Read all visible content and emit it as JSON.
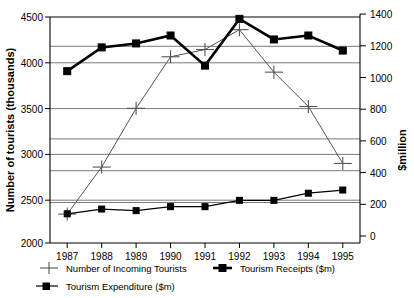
{
  "chart_data": {
    "type": "line",
    "title": "",
    "xlabel": "",
    "ylabel": "Number of tourists (thousands)",
    "y2label": "$million",
    "categories": [
      "1987",
      "1988",
      "1989",
      "1990",
      "1991",
      "1992",
      "1993",
      "1994",
      "1995"
    ],
    "ylim": [
      2000,
      4500
    ],
    "y2lim": [
      0,
      1400
    ],
    "yticks": [
      "2000",
      "2500",
      "3000",
      "3500",
      "4000",
      "4500"
    ],
    "y2ticks": [
      "0",
      "200",
      "400",
      "600",
      "800",
      "1000",
      "1200",
      "1400"
    ],
    "grid": true,
    "legend_position": "bottom-left",
    "series": [
      {
        "name": "Number of Incoming Tourists",
        "axis": "left",
        "marker": "cross",
        "values": [
          2320,
          2840,
          3490,
          4060,
          4140,
          4360,
          3890,
          3510,
          2880
        ]
      },
      {
        "name": "Tourism Receipts ($m)",
        "axis": "right",
        "marker": "square",
        "values": [
          1040,
          1190,
          1215,
          1265,
          1075,
          1370,
          1240,
          1265,
          1170
        ]
      },
      {
        "name": "Tourism Expenditure ($m)",
        "axis": "right",
        "marker": "square",
        "values": [
          140,
          170,
          160,
          185,
          185,
          225,
          225,
          270,
          290
        ]
      }
    ]
  },
  "axes": {
    "left_title": "Number of tourists (thousands)",
    "right_title": "$million"
  },
  "legend": {
    "items": [
      {
        "label": "Number of Incoming Tourists",
        "marker": "cross-marker"
      },
      {
        "label": "Tourism Receipts ($m)",
        "marker": "square-marker"
      },
      {
        "label": "Tourism Expenditure ($m)",
        "marker": "square-marker"
      }
    ]
  }
}
